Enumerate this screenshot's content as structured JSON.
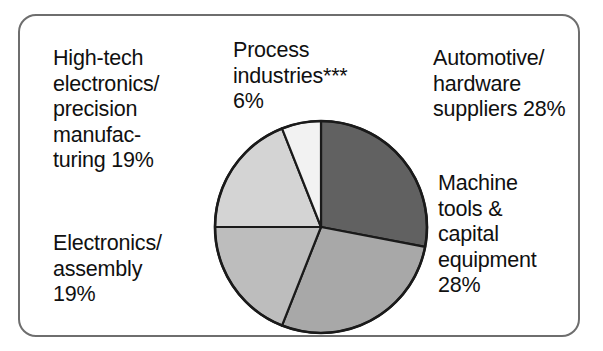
{
  "chart_data": {
    "type": "pie",
    "title": "",
    "subtitle": "",
    "xlabel": "",
    "ylabel": "",
    "legend_position": "none",
    "grid": false,
    "units": "percent",
    "total": 100,
    "categories": [
      "Automotive/ hardware suppliers",
      "Machine tools & capital equipment",
      "Electronics/ assembly",
      "High-tech electronics/ precision manufacturing",
      "Process industries***"
    ],
    "values": [
      28,
      28,
      19,
      19,
      6
    ],
    "slices": [
      {
        "name": "automotive-hardware-suppliers",
        "label": "Automotive/\nhardware\nsuppliers 28%",
        "value": 28,
        "color": "#616161",
        "start_angle": 0,
        "end_angle": 100.8
      },
      {
        "name": "machine-tools-capital-equipment",
        "label": "Machine\ntools &\ncapital\nequipment\n28%",
        "value": 28,
        "color": "#a8a8a8",
        "start_angle": 100.8,
        "end_angle": 201.6
      },
      {
        "name": "electronics-assembly",
        "label": "Electronics/\nassembly\n19%",
        "value": 19,
        "color": "#bdbdbd",
        "start_angle": 201.6,
        "end_angle": 270
      },
      {
        "name": "high-tech-electronics-precision-manufacturing",
        "label": "High-tech\nelectronics/\nprecision\nmanufac-\nturing 19%",
        "value": 19,
        "color": "#d4d4d4",
        "start_angle": 270,
        "end_angle": 338.4
      },
      {
        "name": "process-industries",
        "label": "Process\nindustries***\n6%",
        "value": 6,
        "color": "#f2f2f2",
        "start_angle": 338.4,
        "end_angle": 360
      }
    ],
    "colors": {
      "slice_outline": "#1a1a1a",
      "frame_border": "#6e6e6e",
      "text": "#101010",
      "background": "#ffffff"
    },
    "footnote_marker": "***"
  },
  "labels": {
    "high_tech": "High-tech\nelectronics/\nprecision\nmanufac-\nturing 19%",
    "electronics_assembly": "Electronics/\nassembly\n19%",
    "process_industries": "Process\nindustries***\n6%",
    "automotive": "Automotive/\nhardware\nsuppliers 28%",
    "machine_tools": "Machine\ntools &\ncapital\nequipment\n28%"
  }
}
